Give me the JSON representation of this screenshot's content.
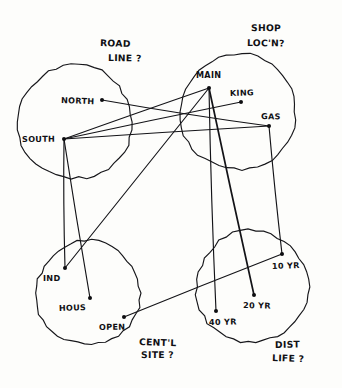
{
  "diagram": {
    "ink_color": "#131317",
    "paper_color": "#fdfdfb",
    "groups": [
      {
        "id": "road-line",
        "label_line1": "ROAD",
        "label_line2": "LINE ?",
        "label_x": 100,
        "label_y": 46,
        "label_x2": 108,
        "label_y2": 61,
        "cx": 75,
        "cy": 122,
        "r": 57
      },
      {
        "id": "shop-locn",
        "label_line1": "SHOP",
        "label_line2": "LOC'N?",
        "label_x": 251,
        "label_y": 31,
        "label_x2": 247,
        "label_y2": 46,
        "cx": 238,
        "cy": 112,
        "r": 58
      },
      {
        "id": "centl-site",
        "label_line1": "CENT'L",
        "label_line2": "SITE ?",
        "label_x": 139,
        "label_y": 345,
        "label_x2": 141,
        "label_y2": 358,
        "cx": 88,
        "cy": 293,
        "r": 52
      },
      {
        "id": "dist-life",
        "label_line1": "DIST",
        "label_line2": "LIFE ?",
        "label_x": 275,
        "label_y": 348,
        "label_x2": 272,
        "label_y2": 361,
        "cx": 252,
        "cy": 287,
        "r": 56
      }
    ],
    "nodes": [
      {
        "id": "north",
        "label": "NORTH",
        "group": "road-line",
        "x": 102,
        "y": 100,
        "lx": 61,
        "ly": 103
      },
      {
        "id": "south",
        "label": "SOUTH",
        "group": "road-line",
        "x": 64,
        "y": 139,
        "lx": 22,
        "ly": 142
      },
      {
        "id": "main",
        "label": "MAIN",
        "group": "shop-locn",
        "x": 209,
        "y": 88,
        "lx": 196,
        "ly": 78
      },
      {
        "id": "king",
        "label": "KING",
        "group": "shop-locn",
        "x": 241,
        "y": 102,
        "lx": 230,
        "ly": 96
      },
      {
        "id": "gas",
        "label": "GAS",
        "group": "shop-locn",
        "x": 269,
        "y": 126,
        "lx": 261,
        "ly": 119
      },
      {
        "id": "ind",
        "label": "IND",
        "group": "centl-site",
        "x": 65,
        "y": 268,
        "lx": 43,
        "ly": 281
      },
      {
        "id": "hous",
        "label": "HOUS",
        "group": "centl-site",
        "x": 90,
        "y": 298,
        "lx": 59,
        "ly": 311
      },
      {
        "id": "open",
        "label": "OPEN",
        "group": "centl-site",
        "x": 124,
        "y": 317,
        "lx": 99,
        "ly": 330
      },
      {
        "id": "yr10",
        "label": "10 YR",
        "group": "dist-life",
        "x": 282,
        "y": 254,
        "lx": 272,
        "ly": 269
      },
      {
        "id": "yr20",
        "label": "20 YR",
        "group": "dist-life",
        "x": 254,
        "y": 295,
        "lx": 243,
        "ly": 308
      },
      {
        "id": "yr40",
        "label": "40 YR",
        "group": "dist-life",
        "x": 216,
        "y": 311,
        "lx": 209,
        "ly": 325
      }
    ],
    "edges": [
      {
        "id": "north-gas",
        "from": "north",
        "to": "gas",
        "weight": "normal"
      },
      {
        "id": "south-main",
        "from": "south",
        "to": "main",
        "weight": "normal"
      },
      {
        "id": "south-king",
        "from": "south",
        "to": "king",
        "weight": "normal"
      },
      {
        "id": "south-gas",
        "from": "south",
        "to": "gas",
        "weight": "normal"
      },
      {
        "id": "south-ind",
        "from": "south",
        "to": "ind",
        "weight": "normal"
      },
      {
        "id": "south-hous",
        "from": "south",
        "to": "hous",
        "weight": "normal"
      },
      {
        "id": "ind-main",
        "from": "ind",
        "to": "main",
        "weight": "normal"
      },
      {
        "id": "main-yr40",
        "from": "main",
        "to": "yr40",
        "weight": "normal"
      },
      {
        "id": "main-yr20",
        "from": "main",
        "to": "yr20",
        "weight": "heavy"
      },
      {
        "id": "gas-yr10",
        "from": "gas",
        "to": "yr10",
        "weight": "normal"
      },
      {
        "id": "open-yr10",
        "from": "open",
        "to": "yr10",
        "weight": "normal"
      }
    ]
  }
}
